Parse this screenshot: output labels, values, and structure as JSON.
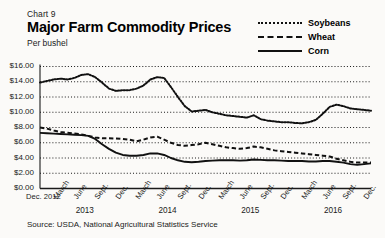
{
  "header": {
    "chart_number": "Chart 9",
    "title": "Major Farm Commodity Prices",
    "subtitle": "Per bushel"
  },
  "legend": {
    "position": "top-right",
    "items": [
      {
        "label": "Soybeans",
        "style": "dotted",
        "color": "#111111"
      },
      {
        "label": "Wheat",
        "style": "dashed",
        "color": "#111111"
      },
      {
        "label": "Corn",
        "style": "solid",
        "color": "#111111"
      }
    ]
  },
  "source": "Source: USDA, National Agricultural Statistics Service",
  "axis": {
    "y_ticks": [
      "$0.00",
      "$2.00",
      "$4.00",
      "$6.00",
      "$8.00",
      "$10.00",
      "$12.00",
      "$14.00",
      "$16.00"
    ],
    "x_first_label": "Dec. 2012",
    "x_quarters": [
      "March",
      "June",
      "Sept.",
      "Dec."
    ],
    "years": [
      "2013",
      "2014",
      "2015",
      "2016"
    ]
  },
  "chart_data": {
    "type": "line",
    "title": "Major Farm Commodity Prices",
    "subtitle": "Per bushel",
    "xlabel": "",
    "ylabel": "Per bushel",
    "ylim": [
      0,
      16
    ],
    "ytick_step": 2,
    "grid": true,
    "grid_style": "dotted-horizontal",
    "legend_position": "top-right",
    "x": [
      "Dec. 2012",
      "Jan. 2013",
      "Feb. 2013",
      "March 2013",
      "April 2013",
      "May 2013",
      "June 2013",
      "July 2013",
      "Aug. 2013",
      "Sept. 2013",
      "Oct. 2013",
      "Nov. 2013",
      "Dec. 2013",
      "Jan. 2014",
      "Feb. 2014",
      "March 2014",
      "April 2014",
      "May 2014",
      "June 2014",
      "July 2014",
      "Aug. 2014",
      "Sept. 2014",
      "Oct. 2014",
      "Nov. 2014",
      "Dec. 2014",
      "Jan. 2015",
      "Feb. 2015",
      "March 2015",
      "April 2015",
      "May 2015",
      "June 2015",
      "July 2015",
      "Aug. 2015",
      "Sept. 2015",
      "Oct. 2015",
      "Nov. 2015",
      "Dec. 2015",
      "Jan. 2016",
      "Feb. 2016",
      "March 2016",
      "April 2016",
      "May 2016",
      "June 2016",
      "July 2016",
      "Aug. 2016",
      "Sept. 2016",
      "Oct. 2016",
      "Nov. 2016",
      "Dec. 2016"
    ],
    "series": [
      {
        "name": "Soybeans",
        "style": "dotted",
        "color": "#111111",
        "unit": "USD per bushel",
        "values": [
          13.9,
          14.1,
          14.3,
          14.4,
          14.3,
          14.5,
          14.9,
          15.0,
          14.6,
          13.9,
          13.1,
          12.8,
          12.9,
          12.9,
          13.1,
          13.5,
          14.3,
          14.6,
          14.5,
          13.3,
          12.0,
          10.8,
          10.1,
          10.2,
          10.3,
          10.0,
          9.8,
          9.6,
          9.5,
          9.4,
          9.3,
          9.6,
          9.1,
          8.9,
          8.8,
          8.7,
          8.7,
          8.6,
          8.55,
          8.7,
          9.0,
          9.8,
          10.7,
          11.0,
          10.8,
          10.5,
          10.4,
          10.3,
          10.2
        ]
      },
      {
        "name": "Wheat",
        "style": "dashed",
        "color": "#111111",
        "unit": "USD per bushel",
        "values": [
          8.0,
          7.85,
          7.6,
          7.4,
          7.3,
          7.2,
          7.1,
          6.9,
          6.7,
          6.6,
          6.6,
          6.55,
          6.5,
          6.4,
          6.2,
          6.4,
          6.7,
          6.8,
          6.4,
          6.0,
          5.7,
          5.6,
          5.7,
          5.8,
          6.0,
          5.8,
          5.6,
          5.4,
          5.3,
          5.2,
          5.3,
          5.5,
          5.4,
          5.2,
          5.0,
          4.9,
          4.8,
          4.7,
          4.6,
          4.5,
          4.4,
          4.3,
          4.2,
          3.9,
          3.7,
          3.5,
          3.4,
          3.4,
          3.4
        ]
      },
      {
        "name": "Corn",
        "style": "solid",
        "color": "#111111",
        "unit": "USD per bushel",
        "values": [
          7.3,
          7.25,
          7.2,
          7.15,
          7.1,
          7.05,
          7.0,
          6.9,
          6.5,
          5.8,
          5.2,
          4.7,
          4.4,
          4.3,
          4.3,
          4.4,
          4.6,
          4.6,
          4.4,
          4.0,
          3.7,
          3.5,
          3.45,
          3.5,
          3.6,
          3.65,
          3.7,
          3.7,
          3.7,
          3.65,
          3.7,
          3.8,
          3.75,
          3.7,
          3.7,
          3.65,
          3.6,
          3.6,
          3.6,
          3.55,
          3.55,
          3.6,
          3.6,
          3.5,
          3.4,
          3.2,
          3.1,
          3.2,
          3.3
        ]
      }
    ]
  }
}
